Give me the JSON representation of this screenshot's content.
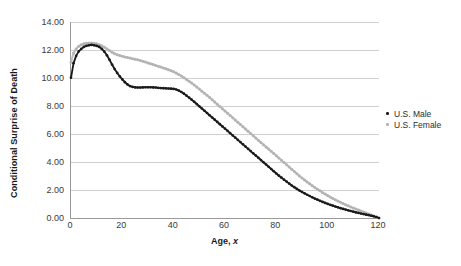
{
  "chart_data": {
    "type": "scatter",
    "title": "",
    "xlabel": "Age, x",
    "ylabel": "Conditional Surprise of Death",
    "xlim": [
      0,
      120
    ],
    "ylim": [
      0,
      14
    ],
    "grid": true,
    "legend_position": "right",
    "x_ticks": [
      "0",
      "20",
      "40",
      "60",
      "80",
      "100",
      "120"
    ],
    "x_tick_values": [
      0,
      20,
      40,
      60,
      80,
      100,
      120
    ],
    "y_ticks": [
      "0.00",
      "2.00",
      "4.00",
      "6.00",
      "8.00",
      "10.00",
      "12.00",
      "14.00"
    ],
    "y_tick_values": [
      0,
      2,
      4,
      6,
      8,
      10,
      12,
      14
    ],
    "colors": {
      "male": "#1a1a1a",
      "female": "#b3b3b3",
      "grid": "#d0d0d0",
      "axis": "#9a9a9a"
    },
    "x": [
      0,
      1,
      2,
      3,
      4,
      5,
      6,
      7,
      8,
      9,
      10,
      11,
      12,
      13,
      14,
      15,
      16,
      17,
      18,
      19,
      20,
      21,
      22,
      23,
      24,
      25,
      26,
      27,
      28,
      29,
      30,
      31,
      32,
      33,
      34,
      35,
      36,
      37,
      38,
      39,
      40,
      41,
      42,
      43,
      44,
      45,
      46,
      47,
      48,
      49,
      50,
      51,
      52,
      53,
      54,
      55,
      56,
      57,
      58,
      59,
      60,
      61,
      62,
      63,
      64,
      65,
      66,
      67,
      68,
      69,
      70,
      71,
      72,
      73,
      74,
      75,
      76,
      77,
      78,
      79,
      80,
      81,
      82,
      83,
      84,
      85,
      86,
      87,
      88,
      89,
      90,
      91,
      92,
      93,
      94,
      95,
      96,
      97,
      98,
      99,
      100,
      101,
      102,
      103,
      104,
      105,
      106,
      107,
      108,
      109,
      110,
      111,
      112,
      113,
      114,
      115,
      116,
      117,
      118,
      119,
      120
    ],
    "series": [
      {
        "name": "U.S. Male",
        "marker": "dot-filled",
        "color": "#1a1a1a",
        "values": [
          10.02,
          11.06,
          11.58,
          11.9,
          12.08,
          12.22,
          12.3,
          12.34,
          12.36,
          12.34,
          12.3,
          12.22,
          12.08,
          11.88,
          11.62,
          11.3,
          10.96,
          10.64,
          10.36,
          10.12,
          9.9,
          9.7,
          9.54,
          9.42,
          9.36,
          9.33,
          9.32,
          9.32,
          9.33,
          9.34,
          9.34,
          9.34,
          9.33,
          9.32,
          9.3,
          9.28,
          9.27,
          9.26,
          9.25,
          9.24,
          9.22,
          9.18,
          9.1,
          9.0,
          8.88,
          8.74,
          8.6,
          8.45,
          8.3,
          8.14,
          7.98,
          7.82,
          7.66,
          7.5,
          7.34,
          7.18,
          7.02,
          6.86,
          6.7,
          6.54,
          6.38,
          6.22,
          6.06,
          5.9,
          5.74,
          5.58,
          5.42,
          5.26,
          5.1,
          4.94,
          4.78,
          4.62,
          4.46,
          4.3,
          4.14,
          3.98,
          3.82,
          3.66,
          3.5,
          3.34,
          3.18,
          3.02,
          2.88,
          2.74,
          2.6,
          2.46,
          2.32,
          2.2,
          2.08,
          1.96,
          1.86,
          1.76,
          1.66,
          1.57,
          1.48,
          1.39,
          1.31,
          1.23,
          1.15,
          1.08,
          1.01,
          0.94,
          0.88,
          0.82,
          0.76,
          0.7,
          0.65,
          0.6,
          0.55,
          0.5,
          0.45,
          0.4,
          0.36,
          0.32,
          0.28,
          0.24,
          0.2,
          0.16,
          0.12,
          0.07,
          0.0
        ]
      },
      {
        "name": "U.S. Female",
        "marker": "dot-open",
        "color": "#b3b3b3",
        "values": [
          11.12,
          11.78,
          12.08,
          12.26,
          12.38,
          12.44,
          12.48,
          12.5,
          12.5,
          12.48,
          12.44,
          12.38,
          12.3,
          12.2,
          12.08,
          11.96,
          11.84,
          11.74,
          11.66,
          11.6,
          11.55,
          11.5,
          11.46,
          11.42,
          11.38,
          11.34,
          11.3,
          11.25,
          11.2,
          11.14,
          11.08,
          11.02,
          10.96,
          10.9,
          10.84,
          10.78,
          10.72,
          10.66,
          10.59,
          10.52,
          10.44,
          10.35,
          10.25,
          10.14,
          10.02,
          9.9,
          9.77,
          9.64,
          9.5,
          9.36,
          9.21,
          9.06,
          8.91,
          8.76,
          8.6,
          8.44,
          8.28,
          8.12,
          7.96,
          7.8,
          7.64,
          7.48,
          7.32,
          7.16,
          7.0,
          6.84,
          6.68,
          6.52,
          6.36,
          6.2,
          6.04,
          5.88,
          5.72,
          5.56,
          5.4,
          5.24,
          5.08,
          4.92,
          4.76,
          4.6,
          4.44,
          4.28,
          4.12,
          3.96,
          3.8,
          3.64,
          3.48,
          3.32,
          3.16,
          3.0,
          2.86,
          2.72,
          2.58,
          2.44,
          2.31,
          2.18,
          2.06,
          1.94,
          1.82,
          1.71,
          1.6,
          1.5,
          1.4,
          1.3,
          1.21,
          1.12,
          1.03,
          0.95,
          0.87,
          0.79,
          0.71,
          0.64,
          0.57,
          0.5,
          0.43,
          0.36,
          0.29,
          0.22,
          0.15,
          0.08,
          0.0
        ]
      }
    ]
  }
}
